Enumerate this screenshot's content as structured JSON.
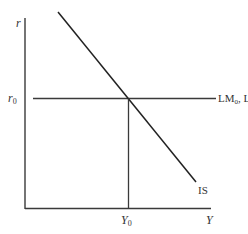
{
  "diagram": {
    "axes": {
      "y_label": "r",
      "x_label": "Y"
    },
    "curves": {
      "is_label": "IS",
      "lm_label_main": "LM",
      "lm_sub0": "0",
      "lm_sep": ", LM",
      "lm_sub1": "1"
    },
    "equilibrium": {
      "r_label_main": "r",
      "r_label_sub": "0",
      "y_label_main": "Y",
      "y_label_sub": "0"
    },
    "colors": {
      "line": "#2b2b2b",
      "text": "#333333"
    }
  }
}
